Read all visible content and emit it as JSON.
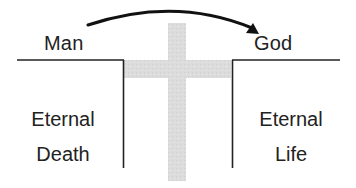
{
  "diagram": {
    "title": "",
    "labels": {
      "left_top": "Man",
      "right_top": "God"
    },
    "regions": {
      "left": {
        "line1": "Eternal",
        "line2": "Death"
      },
      "right": {
        "line1": "Eternal",
        "line2": "Life"
      }
    },
    "arrow": {
      "from": "Man",
      "to": "God",
      "color": "#111111"
    },
    "bridge": {
      "shape": "cross",
      "color": "#d9d9d9"
    },
    "colors": {
      "line": "#222222",
      "cross": "#d9d9d9",
      "text": "#222222",
      "background": "#ffffff"
    }
  }
}
